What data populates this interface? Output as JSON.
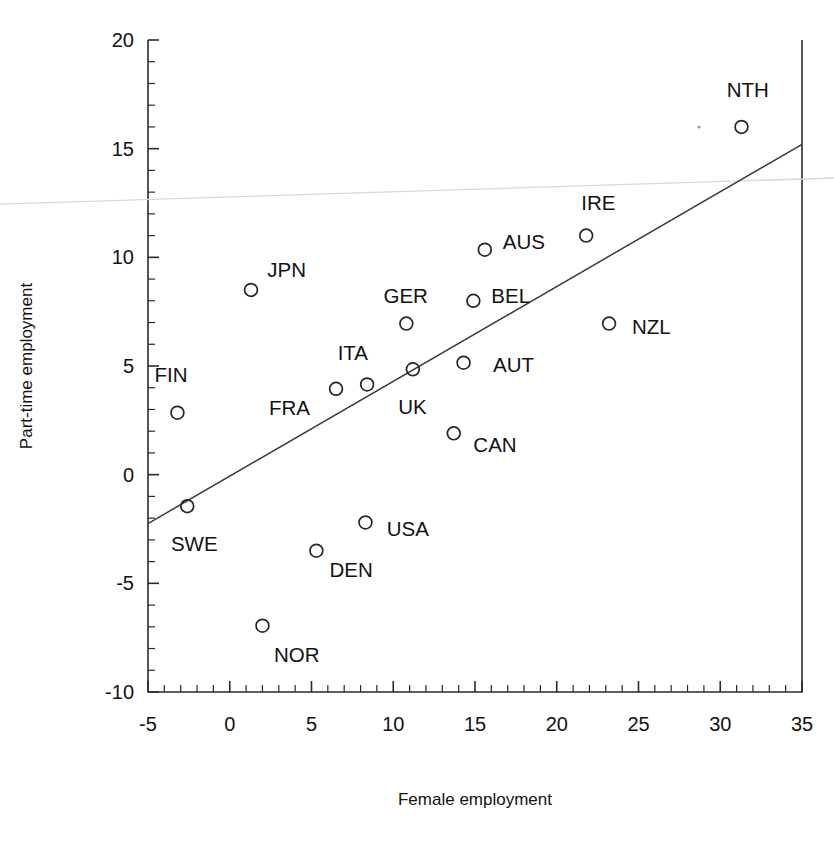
{
  "chart_data": {
    "type": "scatter",
    "title": "",
    "xlabel": "Female employment",
    "ylabel": "Part-time employment",
    "xlim": [
      -5,
      35
    ],
    "ylim": [
      -10,
      20
    ],
    "x_ticks": [
      -5,
      0,
      5,
      10,
      15,
      20,
      25,
      30,
      35
    ],
    "y_ticks": [
      -10,
      -5,
      0,
      5,
      10,
      15,
      20
    ],
    "x_tick_labels": [
      "-5",
      "0",
      "5",
      "10",
      "15",
      "20",
      "25",
      "30",
      "35"
    ],
    "y_tick_labels": [
      "-10",
      "-5",
      "0",
      "5",
      "10",
      "15",
      "20"
    ],
    "x_minor_step": 1,
    "y_minor_step": 1,
    "grid": false,
    "legend": "none",
    "marker_style": "open-circle",
    "points": [
      {
        "label": "FIN",
        "x": -3.2,
        "y": 2.85,
        "lx": -4.6,
        "ly": 4.6
      },
      {
        "label": "SWE",
        "x": -2.6,
        "y": -1.45,
        "lx": -3.6,
        "ly": -3.2
      },
      {
        "label": "JPN",
        "x": 1.3,
        "y": 8.5,
        "lx": 2.3,
        "ly": 9.4
      },
      {
        "label": "NOR",
        "x": 2.0,
        "y": -6.95,
        "lx": 2.7,
        "ly": -8.3
      },
      {
        "label": "DEN",
        "x": 5.3,
        "y": -3.5,
        "lx": 6.1,
        "ly": -4.4
      },
      {
        "label": "FRA",
        "x": 6.5,
        "y": 3.95,
        "lx": 2.4,
        "ly": 3.05
      },
      {
        "label": "ITA",
        "x": 8.4,
        "y": 4.15,
        "lx": 6.6,
        "ly": 5.6
      },
      {
        "label": "USA",
        "x": 8.3,
        "y": -2.2,
        "lx": 9.6,
        "ly": -2.5
      },
      {
        "label": "GER",
        "x": 10.8,
        "y": 6.95,
        "lx": 9.4,
        "ly": 8.2
      },
      {
        "label": "UK",
        "x": 11.2,
        "y": 4.85,
        "lx": 10.3,
        "ly": 3.1
      },
      {
        "label": "CAN",
        "x": 13.7,
        "y": 1.9,
        "lx": 14.9,
        "ly": 1.35
      },
      {
        "label": "AUT",
        "x": 14.3,
        "y": 5.15,
        "lx": 16.1,
        "ly": 5.05
      },
      {
        "label": "BEL",
        "x": 14.9,
        "y": 8.0,
        "lx": 16.0,
        "ly": 8.2
      },
      {
        "label": "AUS",
        "x": 15.6,
        "y": 10.35,
        "lx": 16.7,
        "ly": 10.7
      },
      {
        "label": "IRE",
        "x": 21.8,
        "y": 11.0,
        "lx": 21.5,
        "ly": 12.5
      },
      {
        "label": "NZL",
        "x": 23.2,
        "y": 6.95,
        "lx": 24.6,
        "ly": 6.8
      },
      {
        "label": "NTH",
        "x": 31.3,
        "y": 16.0,
        "lx": 30.4,
        "ly": 17.7
      }
    ],
    "fit_line": {
      "x0": -5,
      "y0": -2.25,
      "x1": 35,
      "y1": 15.2
    },
    "artifact_line": {
      "x0": -5,
      "y0": 12.45,
      "x1": 35,
      "y1": 13.65
    }
  }
}
